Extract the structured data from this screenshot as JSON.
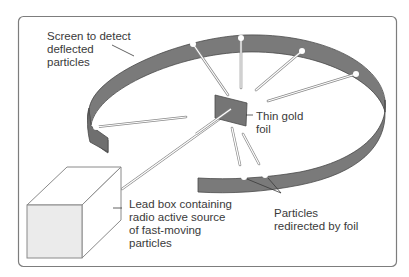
{
  "diagram": {
    "colors": {
      "ring_fill": "#7a7a7a",
      "ring_stroke": "#4a4a4a",
      "foil_fill": "#757575",
      "box_front": "#ebebeb",
      "frame": "#7d7d7d",
      "text": "#3a3a3a",
      "beam": "#ffffff"
    },
    "labels": {
      "screen": [
        "Screen to detect",
        "deflected",
        "particles"
      ],
      "foil": [
        "Thin gold",
        "foil"
      ],
      "lead_box": [
        "Lead box containing",
        "radio active source",
        "of fast-moving",
        "particles"
      ],
      "redirected": [
        "Particles",
        "redirected by foil"
      ]
    }
  }
}
